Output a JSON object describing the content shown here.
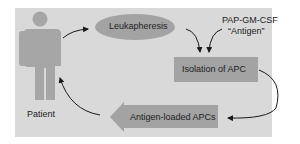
{
  "diagram": {
    "nodes": {
      "patient": {
        "label": "Patient"
      },
      "leukapheresis": {
        "label": "Leukapheresis"
      },
      "antigen": {
        "line1": "PAP-GM-CSF",
        "line2": "“Antigen”"
      },
      "isolation": {
        "label": "Isolation of APC"
      },
      "loaded": {
        "label": "Antigen-loaded APCs"
      }
    },
    "colors": {
      "panel": "#d9d9d9",
      "shape": "#a3a3a3",
      "person": "#a6a6a6",
      "arrow": "#1a1a1a",
      "text": "#222222"
    }
  }
}
